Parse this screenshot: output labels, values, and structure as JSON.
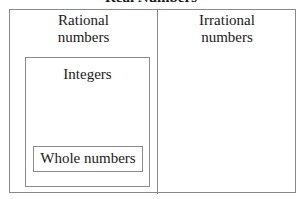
{
  "diagram": {
    "title": "Real Numbers",
    "left_region": {
      "label_line1": "Rational",
      "label_line2": "numbers"
    },
    "right_region": {
      "label_line1": "Irrational",
      "label_line2": "numbers"
    },
    "inner_box": {
      "label": "Integers"
    },
    "innermost_box": {
      "label": "Whole numbers"
    },
    "colors": {
      "border": "#8a8a8a",
      "text": "#1a1a1a",
      "background": "#ffffff"
    }
  }
}
